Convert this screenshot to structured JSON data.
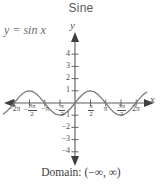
{
  "title": "Sine",
  "equation": {
    "lhs": "y",
    "eq": "=",
    "rhs": "sin x",
    "full": "y = sin x"
  },
  "domain_text": "Domain: (−∞, ∞)",
  "axis_labels": {
    "x": "x",
    "y": "y"
  },
  "colors": {
    "curve": "#7a7a7a",
    "axis": "#5a5a5a",
    "text": "#4d4d4d",
    "title": "#595959",
    "background": "#ffffff"
  },
  "chart_data": {
    "type": "line",
    "title": "Sine",
    "function": "y = sin x",
    "xlabel": "x",
    "ylabel": "y",
    "xlim": [
      -7.4,
      7.4
    ],
    "ylim": [
      -4.6,
      4.6
    ],
    "grid": false,
    "legend": null,
    "annotations": [
      "y = sin x",
      "Domain: (−∞, ∞)"
    ],
    "x_tick_labels": [
      "−2π",
      "−3π/2",
      "−π",
      "−π/2",
      "π/2",
      "π",
      "3π/2",
      "2π"
    ],
    "x_tick_values": [
      -6.2832,
      -4.7124,
      -3.1416,
      -1.5708,
      1.5708,
      3.1416,
      4.7124,
      6.2832
    ],
    "y_tick_labels": [
      "4",
      "3",
      "2",
      "1",
      "−1",
      "−2",
      "−3",
      "−4"
    ],
    "y_tick_values": [
      4,
      3,
      2,
      1,
      -1,
      -2,
      -3,
      -4
    ],
    "series": [
      {
        "name": "sin x",
        "x": [
          -7.4,
          -7.0,
          -6.6,
          -6.2832,
          -5.8,
          -5.4,
          -5.0,
          -4.7124,
          -4.4,
          -4.0,
          -3.6,
          -3.1416,
          -2.8,
          -2.4,
          -2.0,
          -1.5708,
          -1.2,
          -0.8,
          -0.4,
          0,
          0.4,
          0.8,
          1.2,
          1.5708,
          2.0,
          2.4,
          2.8,
          3.1416,
          3.6,
          4.0,
          4.4,
          4.7124,
          5.0,
          5.4,
          5.8,
          6.2832,
          6.6,
          7.0,
          7.4
        ],
        "y": [
          -0.8987,
          -0.657,
          -0.3115,
          0,
          0.4646,
          0.7727,
          0.9589,
          1.0,
          0.9516,
          0.7568,
          0.4425,
          0,
          -0.335,
          -0.6755,
          -0.9093,
          -1.0,
          -0.932,
          -0.7174,
          -0.3894,
          0,
          0.3894,
          0.7174,
          0.932,
          1.0,
          0.9093,
          0.6755,
          0.335,
          0,
          -0.4425,
          -0.7568,
          -0.9516,
          -1.0,
          -0.9589,
          -0.7727,
          -0.4646,
          0,
          0.3115,
          0.657,
          0.8987
        ]
      }
    ]
  },
  "x_ticks": [
    {
      "label_parts": {
        "whole": "−2",
        "pi": "π"
      },
      "kind": "plain",
      "text": "−2π",
      "px": 14
    },
    {
      "label_parts": {
        "sign": "−",
        "num": "3π",
        "den": "2"
      },
      "kind": "frac",
      "text": "−3π/2",
      "px": 30
    },
    {
      "label_parts": {
        "whole": "−",
        "pi": "π"
      },
      "kind": "plain",
      "text": "−π",
      "px": 45
    },
    {
      "label_parts": {
        "sign": "−",
        "num": "π",
        "den": "2"
      },
      "kind": "frac",
      "text": "−π/2",
      "px": 60
    },
    {
      "label_parts": {
        "sign": "",
        "num": "π",
        "den": "2"
      },
      "kind": "frac",
      "text": "π/2",
      "px": 90
    },
    {
      "label_parts": {
        "whole": "",
        "pi": "π"
      },
      "kind": "plain",
      "text": "π",
      "px": 105
    },
    {
      "label_parts": {
        "sign": "",
        "num": "3π",
        "den": "2"
      },
      "kind": "frac",
      "text": "3π/2",
      "px": 120
    },
    {
      "label_parts": {
        "whole": "2",
        "pi": "π"
      },
      "kind": "plain",
      "text": "2π",
      "px": 135
    }
  ],
  "y_ticks": [
    {
      "text": "4",
      "px": 54
    },
    {
      "text": "3",
      "px": 66
    },
    {
      "text": "2",
      "px": 78
    },
    {
      "text": "1",
      "px": 90
    },
    {
      "text": "−1",
      "px": 115
    },
    {
      "text": "−2",
      "px": 127
    },
    {
      "text": "−3",
      "px": 139
    },
    {
      "text": "−4",
      "px": 151
    }
  ]
}
